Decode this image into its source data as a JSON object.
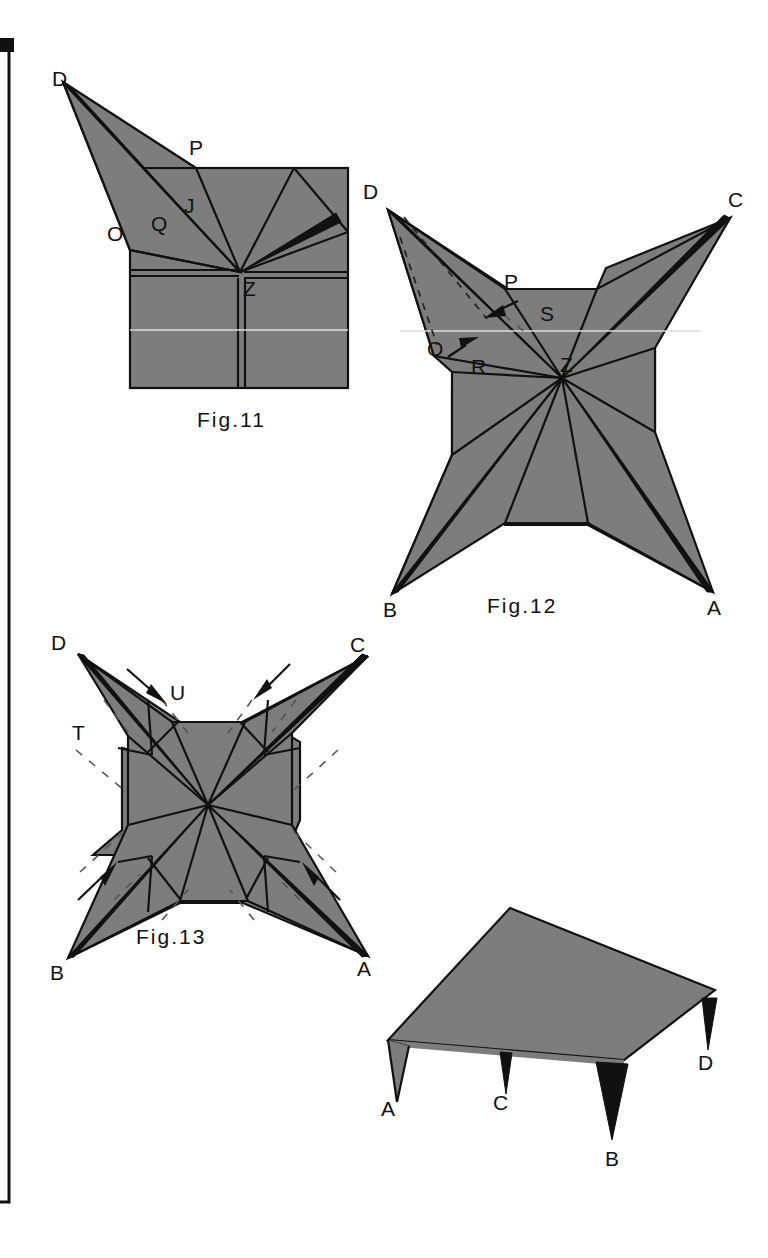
{
  "sheet": {
    "width": 768,
    "height": 1258,
    "background_color": "#ffffff",
    "paper_gray": "#7d7d7d",
    "line_color": "#111111"
  },
  "border": {
    "name": "left-margin-rule",
    "block_label": ""
  },
  "figures": [
    {
      "id": "fig11",
      "caption": "Fig.11",
      "caption_pos": {
        "x": 242,
        "y": 420
      },
      "description": "Square sheet with one corner flap D opened out to the upper left; pleat fan radiating from centre point Z.",
      "labels": [
        {
          "text": "D",
          "x": 52,
          "y": 86
        },
        {
          "text": "P",
          "x": 189,
          "y": 155
        },
        {
          "text": "J",
          "x": 184,
          "y": 213
        },
        {
          "text": "Q",
          "x": 151,
          "y": 231
        },
        {
          "text": "O",
          "x": 107,
          "y": 241
        },
        {
          "text": "Z",
          "x": 243,
          "y": 296
        }
      ]
    },
    {
      "id": "fig12",
      "caption": "Fig.12",
      "caption_pos": {
        "x": 530,
        "y": 611
      },
      "description": "Four-pointed star form with points A, B, C, D; dashed valley folds and two arrows on the D point indicating the next fold.",
      "labels": [
        {
          "text": "D",
          "x": 363,
          "y": 199
        },
        {
          "text": "C",
          "x": 728,
          "y": 207
        },
        {
          "text": "P",
          "x": 504,
          "y": 289
        },
        {
          "text": "S",
          "x": 540,
          "y": 321
        },
        {
          "text": "O",
          "x": 434,
          "y": 356
        },
        {
          "text": "R",
          "x": 471,
          "y": 374
        },
        {
          "text": "Z",
          "x": 562,
          "y": 372
        },
        {
          "text": "B",
          "x": 389,
          "y": 615
        },
        {
          "text": "A",
          "x": 711,
          "y": 613
        }
      ]
    },
    {
      "id": "fig13",
      "caption": "Fig.13",
      "caption_pos": {
        "x": 133,
        "y": 940
      },
      "description": "Star form with all four points pleated inward; four arrows point toward the centre and dashed fold lines mark the sinks.",
      "labels": [
        {
          "text": "D",
          "x": 55,
          "y": 650
        },
        {
          "text": "C",
          "x": 349,
          "y": 652
        },
        {
          "text": "U",
          "x": 169,
          "y": 689
        },
        {
          "text": "T",
          "x": 78,
          "y": 735
        },
        {
          "text": "B",
          "x": 55,
          "y": 963
        },
        {
          "text": "A",
          "x": 354,
          "y": 958
        }
      ]
    },
    {
      "id": "fig14",
      "caption": "",
      "caption_pos": {
        "x": 0,
        "y": 0
      },
      "description": "Finished three-dimensional table form seen in perspective with four tapered legs A, B, C and D.",
      "labels": [
        {
          "text": "A",
          "x": 381,
          "y": 1107
        },
        {
          "text": "C",
          "x": 496,
          "y": 1100
        },
        {
          "text": "B",
          "x": 612,
          "y": 1167
        },
        {
          "text": "D",
          "x": 700,
          "y": 1064
        }
      ]
    }
  ],
  "glossary": {
    "point_a": "A",
    "point_b": "B",
    "point_c": "C",
    "point_d": "D",
    "point_z": "Z",
    "point_o": "O",
    "point_p": "P",
    "point_q": "Q",
    "point_r": "R",
    "point_s": "S",
    "point_t": "T",
    "point_u": "U",
    "point_j": "J"
  }
}
